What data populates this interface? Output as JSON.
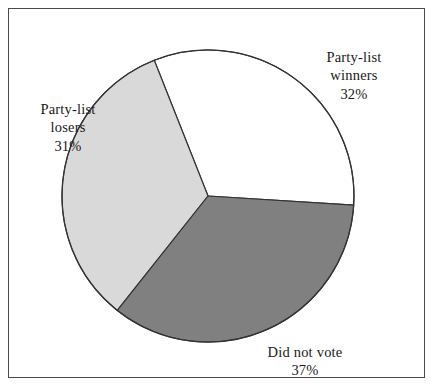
{
  "chart_data": {
    "type": "pie",
    "title": "",
    "subtitle": "",
    "xlabel": "",
    "ylabel": "",
    "grid": false,
    "legend_position": "none",
    "labels_on_slices": true,
    "center": {
      "x": 208,
      "y": 196
    },
    "radius": 146,
    "total_percent": 100,
    "categories": [
      "Party-list winners",
      "Party-list losers",
      "Did not vote"
    ],
    "values": [
      32,
      31,
      37
    ],
    "slices": [
      {
        "name": "Party-list winners",
        "label_line1": "Party-list",
        "label_line2": "winners",
        "value": 32,
        "percent_label": "32%",
        "color": "#ffffff",
        "start_angle_deg": -111.6,
        "end_angle_deg": 3.6,
        "label_position": "right"
      },
      {
        "name": "Party-list losers",
        "label_line1": "Party-list",
        "label_line2": "losers",
        "value": 31,
        "percent_label": "31%",
        "color": "#d9d9d9",
        "start_angle_deg": 128.4,
        "end_angle_deg": 248.4,
        "label_position": "left"
      },
      {
        "name": "Did not vote",
        "label_line1": "Did not vote",
        "label_line2": "",
        "value": 37,
        "percent_label": "37%",
        "color": "#808080",
        "start_angle_deg": 3.6,
        "end_angle_deg": 128.4,
        "label_position": "bottom"
      }
    ],
    "stroke_color": "#333333",
    "stroke_width": 1.2,
    "background_color": "#ffffff",
    "frame_color": "#4a4a4a"
  },
  "labels": {
    "winners": {
      "line1": "Party-list",
      "line2": "winners",
      "percent": "32%"
    },
    "losers": {
      "line1": "Party-list",
      "line2": "losers",
      "percent": "31%"
    },
    "didnotvote": {
      "line1": "Did not vote",
      "percent": "37%"
    }
  }
}
